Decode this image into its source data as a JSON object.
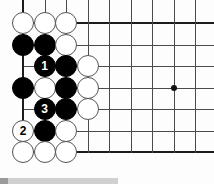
{
  "figure": {
    "type": "go-board-diagram",
    "board": {
      "origin_x": 23,
      "origin_y": 23,
      "spacing": 21.5,
      "cols": 9,
      "rows": 7,
      "edges": {
        "left": true,
        "top": true,
        "bottom": true,
        "right": false
      },
      "line_color": "#4a4a4a",
      "edge_color": "#1c1c1c",
      "background_color": "#fdfdfd"
    },
    "star_points": [
      {
        "name": "star-point-right",
        "col": 8,
        "row": 4
      }
    ],
    "stone_colors": {
      "black": "#000000",
      "white": "#ffffff",
      "black_label": "#ffffff",
      "white_label": "#000000"
    },
    "stones": [
      {
        "name": "white-stone-c1r1",
        "col": 1,
        "row": 1,
        "color": "white",
        "label": ""
      },
      {
        "name": "white-stone-c2r1",
        "col": 2,
        "row": 1,
        "color": "white",
        "label": ""
      },
      {
        "name": "white-stone-c3r1",
        "col": 3,
        "row": 1,
        "color": "white",
        "label": ""
      },
      {
        "name": "black-stone-c1r2",
        "col": 1,
        "row": 2,
        "color": "black",
        "label": ""
      },
      {
        "name": "black-stone-c2r2",
        "col": 2,
        "row": 2,
        "color": "black",
        "label": ""
      },
      {
        "name": "white-stone-c3r2",
        "col": 3,
        "row": 2,
        "color": "white",
        "label": ""
      },
      {
        "name": "black-stone-move-1",
        "col": 2,
        "row": 3,
        "color": "black",
        "label": "1"
      },
      {
        "name": "black-stone-c3r3",
        "col": 3,
        "row": 3,
        "color": "black",
        "label": ""
      },
      {
        "name": "white-stone-c4r3",
        "col": 4,
        "row": 3,
        "color": "white",
        "label": ""
      },
      {
        "name": "black-stone-c1r4",
        "col": 1,
        "row": 4,
        "color": "black",
        "label": ""
      },
      {
        "name": "white-stone-c2r4",
        "col": 2,
        "row": 4,
        "color": "white",
        "label": ""
      },
      {
        "name": "black-stone-c3r4",
        "col": 3,
        "row": 4,
        "color": "black",
        "label": ""
      },
      {
        "name": "white-stone-c4r4",
        "col": 4,
        "row": 4,
        "color": "white",
        "label": ""
      },
      {
        "name": "black-stone-move-3",
        "col": 2,
        "row": 5,
        "color": "black",
        "label": "3"
      },
      {
        "name": "black-stone-c3r5",
        "col": 3,
        "row": 5,
        "color": "black",
        "label": ""
      },
      {
        "name": "white-stone-c4r5",
        "col": 4,
        "row": 5,
        "color": "white",
        "label": ""
      },
      {
        "name": "white-stone-move-2",
        "col": 1,
        "row": 6,
        "color": "white",
        "label": "2"
      },
      {
        "name": "black-stone-c2r6",
        "col": 2,
        "row": 6,
        "color": "black",
        "label": ""
      },
      {
        "name": "white-stone-c3r6",
        "col": 3,
        "row": 6,
        "color": "white",
        "label": ""
      },
      {
        "name": "white-stone-c1r7",
        "col": 1,
        "row": 7,
        "color": "white",
        "label": ""
      },
      {
        "name": "white-stone-c2r7",
        "col": 2,
        "row": 7,
        "color": "white",
        "label": ""
      },
      {
        "name": "white-stone-c3r7",
        "col": 3,
        "row": 7,
        "color": "white",
        "label": ""
      }
    ]
  }
}
